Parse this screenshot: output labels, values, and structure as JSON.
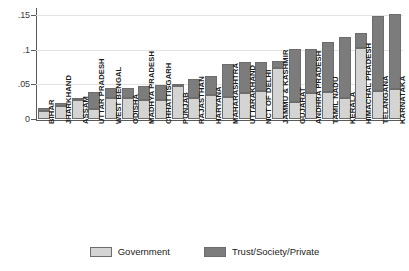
{
  "chart_data": {
    "type": "bar",
    "subtype": "stacked-vertical",
    "title": "",
    "xlabel": "",
    "ylabel": "",
    "ylim": [
      0,
      0.16
    ],
    "grid": true,
    "yticks": [
      0,
      0.05,
      0.1,
      0.15
    ],
    "ytick_labels": [
      "0",
      ".05",
      ".1",
      ".15"
    ],
    "legend_position": "bottom-center",
    "categories": [
      "BIHAR",
      "JHARKHAND",
      "ASSAM",
      "UTTAR PRADESH",
      "WEST BENGAL",
      "ODISHA",
      "MADHYA PRADESH",
      "CHHATTISGARH",
      "PUNJAB",
      "RAJASTHAN",
      "HARYANA",
      "MAHARASHTRA",
      "UTTARAKHAND",
      "NCT OF DELHI",
      "JAMMU & KASHMIR",
      "GUJARAT",
      "ANDHRA PRADESH",
      "TAMIL NADU",
      "KERALA",
      "HIMACHAL PRADESH",
      "TELANGANA",
      "KARNATAKA"
    ],
    "series": [
      {
        "name": "Government",
        "color": "#d4d4d4",
        "values": [
          0.012,
          0.019,
          0.028,
          0.014,
          0.03,
          0.031,
          0.028,
          0.028,
          0.047,
          0.031,
          0.035,
          0.032,
          0.037,
          0.04,
          0.073,
          0.025,
          0.038,
          0.039,
          0.03,
          0.103,
          0.04,
          0.043
        ]
      },
      {
        "name": "Trust/Society/Private",
        "color": "#7c7c7c",
        "values": [
          0.004,
          0.004,
          0.003,
          0.025,
          0.014,
          0.014,
          0.02,
          0.021,
          0.004,
          0.026,
          0.027,
          0.048,
          0.045,
          0.042,
          0.011,
          0.076,
          0.063,
          0.072,
          0.088,
          0.021,
          0.108,
          0.108
        ]
      }
    ],
    "totals": [
      0.016,
      0.023,
      0.031,
      0.039,
      0.044,
      0.045,
      0.048,
      0.049,
      0.051,
      0.057,
      0.062,
      0.08,
      0.082,
      0.082,
      0.084,
      0.101,
      0.101,
      0.111,
      0.118,
      0.124,
      0.148,
      0.151
    ]
  },
  "legend": {
    "items": [
      {
        "label": "Government",
        "color": "#d4d4d4"
      },
      {
        "label": "Trust/Society/Private",
        "color": "#7c7c7c"
      }
    ]
  }
}
